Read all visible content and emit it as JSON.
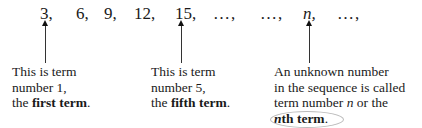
{
  "sequence": {
    "terms": [
      {
        "text": "3,",
        "x": 40
      },
      {
        "text": "6,",
        "x": 76
      },
      {
        "text": "9,",
        "x": 104
      },
      {
        "text": "12,",
        "x": 134
      },
      {
        "text": "15,",
        "x": 175
      },
      {
        "text": "…,",
        "x": 213
      },
      {
        "text": "…,",
        "x": 260
      },
      {
        "text": "n,",
        "x": 303
      },
      {
        "text": "…,",
        "x": 337
      }
    ]
  },
  "arrows": [
    {
      "target": "term-1",
      "x": 45
    },
    {
      "target": "term-5",
      "x": 181
    },
    {
      "target": "term-n",
      "x": 309
    }
  ],
  "annotations": {
    "first": {
      "line1": "This is term",
      "line2": "number 1,",
      "line3_prefix": "the ",
      "line3_bold": "first term",
      "line3_suffix": "."
    },
    "fifth": {
      "line1": "This is term",
      "line2": "number 5,",
      "line3_prefix": "the ",
      "line3_bold": "fifth term",
      "line3_suffix": "."
    },
    "nth": {
      "line1": "An unknown number",
      "line2": "in the sequence is called",
      "line3_prefix": "term number ",
      "line3_italic": "n",
      "line3_suffix": " or the",
      "line4_italic_bold": "n",
      "line4_bold": "th term",
      "line4_suffix": "."
    }
  }
}
